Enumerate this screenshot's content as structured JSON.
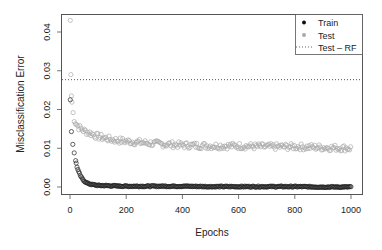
{
  "chart_data": {
    "type": "scatter",
    "title": "",
    "xlabel": "Epochs",
    "ylabel": "Misclassification Error",
    "xlim": [
      -25,
      1025
    ],
    "ylim": [
      -0.0015,
      0.0445
    ],
    "xticks": [
      0,
      200,
      400,
      600,
      800,
      1000
    ],
    "xtick_labels": [
      "0",
      "200",
      "400",
      "600",
      "800",
      "1000"
    ],
    "yticks": [
      0.0,
      0.01,
      0.02,
      0.03,
      0.04
    ],
    "ytick_labels": [
      "0.00",
      "0.01",
      "0.02",
      "0.03",
      "0.04"
    ],
    "grid": false,
    "legend_position": "top-right",
    "series": [
      {
        "name": "Train",
        "marker": "open-circle",
        "color": "#222222",
        "description": "Starts near 0.0225 at epoch 1, drops steeply to ~0.002 by epoch 40 and ~0.0003 by epoch 100, then stays flat near 0.0000-0.0003 through epoch 1000",
        "x": [
          1,
          5,
          10,
          15,
          20,
          25,
          30,
          40,
          50,
          60,
          80,
          100,
          150,
          200,
          300,
          400,
          500,
          600,
          700,
          800,
          900,
          1000
        ],
        "values": [
          0.0225,
          0.0143,
          0.011,
          0.0088,
          0.0068,
          0.0052,
          0.004,
          0.0025,
          0.0016,
          0.001,
          0.0006,
          0.0004,
          0.0003,
          0.0002,
          0.0002,
          0.0002,
          0.0001,
          0.0001,
          0.0001,
          0.0001,
          0.0,
          0.0
        ]
      },
      {
        "name": "Test",
        "marker": "open-circle",
        "color": "#aaaaaa",
        "description": "Starts at 0.043 at epoch 1, ~0.029 at epoch 3, ~0.023 around epoch 5, decays to ~0.015 by epoch 50, ~0.012 by epoch 200, then fluctuates around 0.010-0.011 through epoch 1000",
        "x": [
          1,
          3,
          5,
          10,
          15,
          20,
          30,
          40,
          50,
          75,
          100,
          150,
          200,
          300,
          400,
          500,
          600,
          700,
          800,
          900,
          1000
        ],
        "values": [
          0.043,
          0.029,
          0.0235,
          0.0195,
          0.0175,
          0.0165,
          0.0155,
          0.015,
          0.0145,
          0.0138,
          0.013,
          0.0122,
          0.0118,
          0.0112,
          0.0108,
          0.0106,
          0.0106,
          0.0104,
          0.0104,
          0.0102,
          0.01
        ]
      },
      {
        "name": "Test – RF",
        "marker": "dotted-line",
        "color": "#333333",
        "description": "Horizontal reference line",
        "values": [
          0.0277
        ]
      }
    ],
    "legend": [
      {
        "label": "Train",
        "symbol": "filled-dot",
        "color": "#111111"
      },
      {
        "label": "Test",
        "symbol": "filled-dot",
        "color": "#aaaaaa"
      },
      {
        "label": "Test – RF",
        "symbol": "dotted-line",
        "color": "#333333"
      }
    ]
  },
  "labels": {
    "xlabel": "Epochs",
    "ylabel": "Misclassification Error",
    "legend_train": "Train",
    "legend_test": "Test",
    "legend_rf": "Test – RF"
  }
}
